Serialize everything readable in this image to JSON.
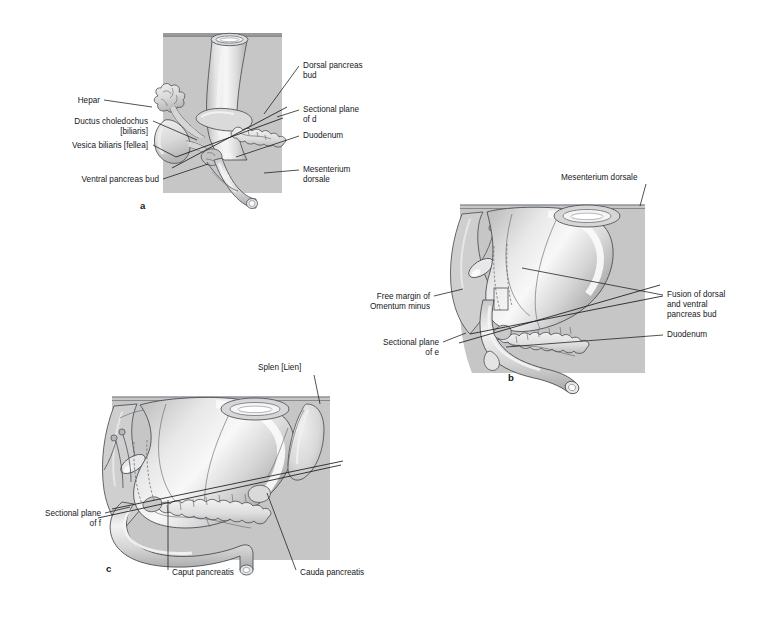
{
  "figure": {
    "background_color": "#ffffff",
    "line_color": "#1a1a1a",
    "mesentery_fill": "#c6c6c6",
    "organ_fill": "#d8d8d8",
    "organ_light": "#ececec",
    "organ_highlight": "#f6f6f6",
    "organ_shadow": "#a9a9a9",
    "outline_color": "#4a4f55"
  },
  "panels": [
    {
      "id": "a",
      "letter": "a",
      "letter_pos": {
        "x": 140,
        "y": 209
      },
      "labels_left": [
        {
          "name": "hepar",
          "text": "Hepar",
          "x": 100,
          "y": 103,
          "anchor": "end",
          "leader": "M 104,100 L 152,107"
        },
        {
          "name": "ductus-choledochus",
          "text": "Ductus choledochus",
          "text2": "[biliaris]",
          "x": 148,
          "y": 124,
          "anchor": "end",
          "leader": "M 152,121 L 197,140"
        },
        {
          "name": "vesica-biliaris",
          "text": "Vesica biliaris [fellea]",
          "x": 148,
          "y": 148,
          "anchor": "end",
          "leader": "M 152,145 L 177,158"
        },
        {
          "name": "ventral-pancreas-bud",
          "text": "Ventral pancreas bud",
          "x": 158,
          "y": 182,
          "anchor": "end",
          "leader": "M 162,179 L 208,166"
        }
      ],
      "labels_right": [
        {
          "name": "dorsal-pancreas-bud",
          "text": "Dorsal pancreas bud",
          "text_lines": [
            "Dorsal pancreas",
            "bud"
          ],
          "x": 303,
          "y": 68,
          "anchor": "start",
          "leader": "M 299,66 L 265,114"
        },
        {
          "name": "sectional-plane-d",
          "text_lines": [
            "Sectional plane",
            "of d"
          ],
          "bold_tail": "d",
          "x": 303,
          "y": 112,
          "anchor": "start",
          "leader": "M 299,110 L 276,118"
        },
        {
          "name": "duodenum",
          "text_lines": [
            "Duodenum"
          ],
          "x": 303,
          "y": 138,
          "anchor": "start",
          "leader": "M 299,136 L 237,157"
        },
        {
          "name": "mesenterium-dorsale",
          "text_lines": [
            "Mesenterium",
            "dorsale"
          ],
          "x": 303,
          "y": 172,
          "anchor": "start",
          "leader": "M 299,170 L 264,174"
        }
      ]
    },
    {
      "id": "b",
      "letter": "b",
      "letter_pos": {
        "x": 508,
        "y": 381
      },
      "labels_left": [
        {
          "name": "free-margin-omentum-minus",
          "text_lines": [
            "Free margin of",
            "Omentum minus"
          ],
          "x": 430,
          "y": 299,
          "anchor": "end",
          "leader": "M 434,296 L 462,290"
        },
        {
          "name": "sectional-plane-e",
          "text_lines": [
            "Sectional plane",
            "of e"
          ],
          "bold_tail": "e",
          "x": 438,
          "y": 345,
          "anchor": "end",
          "leader": "M 442,342 L 466,333"
        }
      ],
      "labels_right": [
        {
          "name": "mesenterium-dorsale",
          "text_lines": [
            "Mesenterium dorsale"
          ],
          "x": 561,
          "y": 180,
          "anchor": "start",
          "leader": "M 646,183 L 640,205"
        },
        {
          "name": "fusion-dorsal-ventral-pancreas-bud",
          "text_lines": [
            "Fusion of dorsal",
            "and ventral",
            "pancreas bud"
          ],
          "x": 667,
          "y": 297,
          "anchor": "start",
          "leader": "M 663,295 L 522,268"
        },
        {
          "name": "duodenum",
          "text_lines": [
            "Duodenum"
          ],
          "x": 667,
          "y": 337,
          "anchor": "start",
          "leader": "M 663,335 L 506,347"
        }
      ]
    },
    {
      "id": "c",
      "letter": "c",
      "letter_pos": {
        "x": 106,
        "y": 572
      },
      "labels_left": [
        {
          "name": "sectional-plane-f",
          "text_lines": [
            "Sectional plane",
            "of f"
          ],
          "bold_tail": "f",
          "x": 101,
          "y": 516,
          "anchor": "end",
          "leader": "M 105,513 L 130,507"
        }
      ],
      "labels_right": [
        {
          "name": "splen-lien",
          "text_lines": [
            "Splen [Lien]"
          ],
          "x": 258,
          "y": 370,
          "anchor": "start",
          "leader": "M 314,374 L 320,404"
        }
      ],
      "labels_bottom": [
        {
          "name": "caput-pancreatis",
          "text_lines": [
            "Caput pancreatis"
          ],
          "x": 172,
          "y": 574,
          "anchor": "start",
          "leader": "M 168,570 L 168,499"
        },
        {
          "name": "cauda-pancreatis",
          "text_lines": [
            "Cauda pancreatis"
          ],
          "x": 300,
          "y": 574,
          "anchor": "start",
          "leader": "M 296,570 L 267,492"
        }
      ]
    }
  ],
  "terms": {
    "hepar": "Hepar",
    "ductus_choledochus": "Ductus choledochus",
    "biliaris": "[biliaris]",
    "vesica_biliaris": "Vesica biliaris [fellea]",
    "ventral_pancreas_bud": "Ventral pancreas bud",
    "dorsal_pancreas_bud_l1": "Dorsal pancreas",
    "dorsal_pancreas_bud_l2": "bud",
    "sectional_plane": "Sectional plane",
    "of_d": "of ",
    "d": "d",
    "of_e": "of ",
    "e": "e",
    "of_f": "of ",
    "f": "f",
    "duodenum": "Duodenum",
    "mesenterium_l1": "Mesenterium",
    "mesenterium_l2": "dorsale",
    "mesenterium_dorsale": "Mesenterium dorsale",
    "free_margin_l1": "Free margin of",
    "free_margin_l2": "Omentum minus",
    "fusion_l1": "Fusion of dorsal",
    "fusion_l2": "and ventral",
    "fusion_l3": "pancreas bud",
    "splen_lien": "Splen [Lien]",
    "caput_pancreatis": "Caput pancreatis",
    "cauda_pancreatis": "Cauda pancreatis",
    "letter_a": "a",
    "letter_b": "b",
    "letter_c": "c"
  }
}
